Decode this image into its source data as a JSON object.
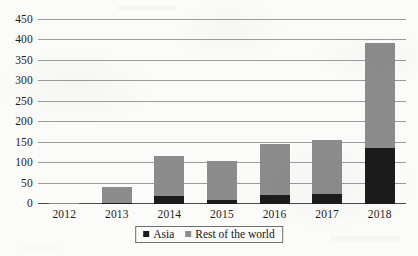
{
  "chart_data": {
    "type": "bar",
    "subtype": "stacked-bar",
    "title": "",
    "xlabel": "",
    "ylabel": "",
    "categories": [
      "2012",
      "2013",
      "2014",
      "2015",
      "2016",
      "2017",
      "2018"
    ],
    "series": [
      {
        "name": "Asia",
        "color": "#1b1b1b",
        "values": [
          1,
          2,
          20,
          10,
          21,
          25,
          137
        ]
      },
      {
        "name": "Rest of the world",
        "color": "#8c8c8c",
        "values": [
          2,
          40,
          97,
          95,
          127,
          131,
          257
        ]
      }
    ],
    "totals": [
      3,
      42,
      117,
      105,
      148,
      156,
      394
    ],
    "ylim": [
      0,
      450
    ],
    "yticks": [
      0,
      50,
      100,
      150,
      200,
      250,
      300,
      350,
      400,
      450
    ],
    "ytick_labels": [
      "0",
      "50",
      "100",
      "150",
      "200",
      "250",
      "300",
      "350",
      "400",
      "450"
    ],
    "grid": true,
    "grid_axis": "y",
    "legend_position": "bottom-center",
    "legend_entries": [
      "Asia",
      "Rest of the world"
    ]
  },
  "legend": {
    "items": [
      {
        "label": "Asia",
        "color": "#1b1b1b"
      },
      {
        "label": "Rest of the world",
        "color": "#8c8c8c"
      }
    ]
  },
  "colors": {
    "asia": "#1b1b1b",
    "rest_of_world": "#8c8c8c",
    "gridline": "#9b9b9b",
    "axis": "#4a4a4a",
    "text": "#1d1d1d",
    "background": "#fbfbf9"
  }
}
